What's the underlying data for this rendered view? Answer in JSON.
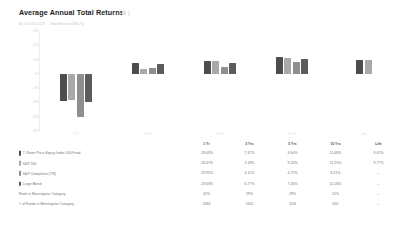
{
  "header": {
    "title": "Average Annual Total Returns",
    "subtitle_left": "As of 12/31/2023",
    "subtitle_right": "Total Returns (USD %)"
  },
  "legend_colors": {
    "fund": "#4d4d4d",
    "index": "#a9a9a9",
    "completion": "#8f8f8f",
    "category": "#5c5c5c"
  },
  "chart_data": {
    "type": "bar",
    "title": "Average Annual Total Returns",
    "xlabel": "",
    "ylabel": "",
    "ylim": [
      -40,
      30
    ],
    "grid": false,
    "legend_position": "none",
    "categories": [
      "1 Yr",
      "3 Yrs",
      "5 Yrs",
      "10 Yrs",
      "Life"
    ],
    "yticks": [
      "30%",
      "20%",
      "10%",
      "0%",
      "-10%",
      "-20%",
      "-30%",
      "-40%"
    ],
    "series": [
      {
        "name": "T. Rowe Price Equity Index 500 Fund",
        "color": "#4d4d4d",
        "values": [
          -19.03,
          7.47,
          9.0,
          11.48,
          9.47
        ]
      },
      {
        "name": "S&P 500",
        "color": "#a9a9a9",
        "values": [
          -18.47,
          3.18,
          9.24,
          11.13,
          9.77
        ]
      },
      {
        "name": "S&P Completion (TR)",
        "color": "#8f8f8f",
        "values": [
          -29.92,
          4.15,
          4.72,
          8.21,
          null
        ]
      },
      {
        "name": "Large Blend",
        "color": "#5c5c5c",
        "values": [
          -19.63,
          6.77,
          7.56,
          10.26,
          null
        ]
      }
    ]
  },
  "table": {
    "columns": [
      "1 Yr",
      "3 Yrs",
      "5 Yrs",
      "10 Yrs",
      "Life"
    ],
    "rows": [
      {
        "label": "T. Rowe Price Equity Index 500 Fund",
        "swatch": "#4d4d4d",
        "values": [
          "-19.03%",
          "7.47%",
          "9.00%",
          "11.48%",
          "9.47%"
        ]
      },
      {
        "label": "S&P 500",
        "swatch": "#a9a9a9",
        "values": [
          "-18.47%",
          "3.18%",
          "9.24%",
          "11.13%",
          "9.77%"
        ]
      },
      {
        "label": "S&P Completion (TR)",
        "swatch": "#8f8f8f",
        "values": [
          "-29.92%",
          "4.15%",
          "4.72%",
          "8.21%",
          "–"
        ]
      },
      {
        "label": "Large Blend",
        "swatch": "#5c5c5c",
        "values": [
          "-19.63%",
          "6.77%",
          "7.56%",
          "10.26%",
          "–"
        ]
      },
      {
        "label": "Rank in Morningstar Category",
        "swatch": null,
        "values": [
          "45%",
          "29%",
          "29%",
          "21%",
          "–"
        ]
      },
      {
        "label": "# of Funds in Morningstar Category",
        "swatch": null,
        "values": [
          "1366",
          "1201",
          "1116",
          "820",
          "–"
        ]
      }
    ]
  }
}
